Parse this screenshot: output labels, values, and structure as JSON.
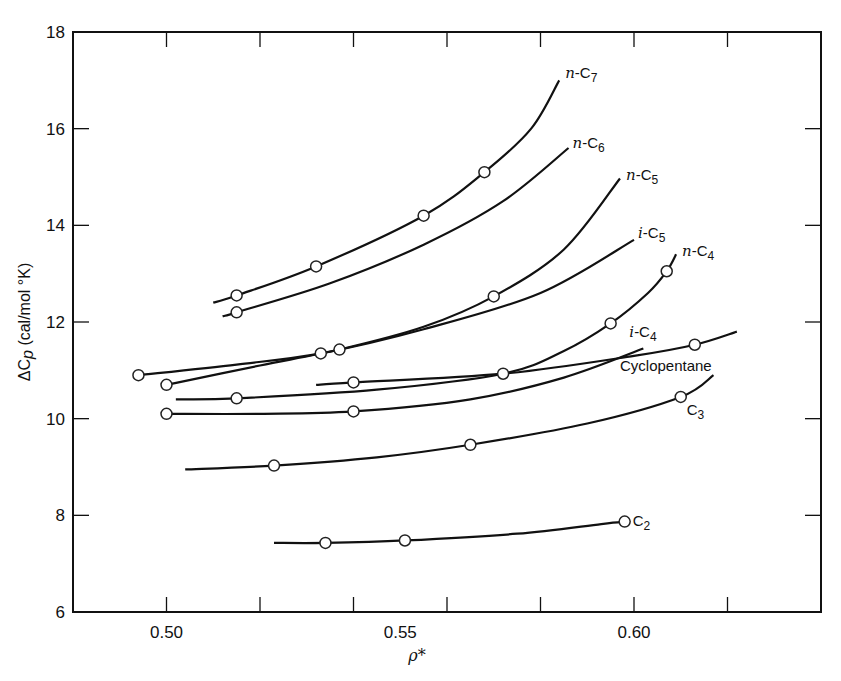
{
  "chart_data": {
    "type": "line",
    "title": "",
    "xlabel": "ρ*",
    "ylabel": "ΔCp (cal/mol °K)",
    "xlim": [
      0.48,
      0.64
    ],
    "ylim": [
      6,
      18
    ],
    "x_ticks": [
      0.49,
      0.5,
      0.51,
      0.52,
      0.53,
      0.54,
      0.55,
      0.56,
      0.57,
      0.58,
      0.59,
      0.6,
      0.61,
      0.62,
      0.63
    ],
    "x_major_ticks": [
      0.5,
      0.52,
      0.54,
      0.56,
      0.58,
      0.6,
      0.62
    ],
    "x_tick_labels": [
      {
        "value": 0.5,
        "label": "0.50"
      },
      {
        "value": 0.55,
        "label": "0.55"
      },
      {
        "value": 0.6,
        "label": "0.60"
      }
    ],
    "y_ticks": [
      6,
      8,
      10,
      12,
      14,
      16,
      18
    ],
    "y_tick_labels": [
      "6",
      "8",
      "10",
      "12",
      "14",
      "16",
      "18"
    ],
    "grid": false,
    "legend": "inline labels at curve ends",
    "series": [
      {
        "name": "n-C7",
        "label_main": "n",
        "label_rest": "-C",
        "label_sub": "7",
        "curve": [
          [
            0.51,
            12.4
          ],
          [
            0.515,
            12.55
          ],
          [
            0.532,
            13.15
          ],
          [
            0.555,
            14.2
          ],
          [
            0.568,
            15.1
          ],
          [
            0.578,
            16.0
          ],
          [
            0.584,
            17.0
          ]
        ],
        "points": [
          [
            0.515,
            12.55
          ],
          [
            0.532,
            13.15
          ],
          [
            0.555,
            14.2
          ],
          [
            0.568,
            15.1
          ]
        ]
      },
      {
        "name": "n-C6",
        "label_main": "n",
        "label_rest": "-C",
        "label_sub": "6",
        "curve": [
          [
            0.512,
            12.12
          ],
          [
            0.515,
            12.2
          ],
          [
            0.535,
            12.8
          ],
          [
            0.555,
            13.6
          ],
          [
            0.572,
            14.5
          ],
          [
            0.586,
            15.6
          ]
        ],
        "points": [
          [
            0.515,
            12.2
          ]
        ]
      },
      {
        "name": "n-C5",
        "label_main": "n",
        "label_rest": "-C",
        "label_sub": "5",
        "curve": [
          [
            0.5,
            10.7
          ],
          [
            0.52,
            11.1
          ],
          [
            0.537,
            11.43
          ],
          [
            0.555,
            11.9
          ],
          [
            0.57,
            12.53
          ],
          [
            0.585,
            13.5
          ],
          [
            0.597,
            14.97
          ]
        ],
        "points": [
          [
            0.5,
            10.7
          ],
          [
            0.537,
            11.43
          ],
          [
            0.57,
            12.53
          ]
        ]
      },
      {
        "name": "i-C5",
        "label_main": "i",
        "label_rest": "-C",
        "label_sub": "5",
        "curve": [
          [
            0.494,
            10.9
          ],
          [
            0.515,
            11.12
          ],
          [
            0.533,
            11.35
          ],
          [
            0.555,
            11.85
          ],
          [
            0.58,
            12.6
          ],
          [
            0.6,
            13.7
          ]
        ],
        "points": [
          [
            0.494,
            10.9
          ],
          [
            0.533,
            11.35
          ]
        ]
      },
      {
        "name": "n-C4",
        "label_main": "n",
        "label_rest": "-C",
        "label_sub": "4",
        "curve": [
          [
            0.502,
            10.4
          ],
          [
            0.515,
            10.42
          ],
          [
            0.545,
            10.6
          ],
          [
            0.572,
            10.93
          ],
          [
            0.585,
            11.4
          ],
          [
            0.595,
            11.97
          ],
          [
            0.603,
            12.6
          ],
          [
            0.607,
            13.05
          ],
          [
            0.609,
            13.4
          ]
        ],
        "points": [
          [
            0.515,
            10.42
          ],
          [
            0.572,
            10.93
          ],
          [
            0.595,
            11.97
          ],
          [
            0.607,
            13.05
          ]
        ]
      },
      {
        "name": "i-C4",
        "label_main": "i",
        "label_rest": "-C",
        "label_sub": "4",
        "curve": [
          [
            0.5,
            10.1
          ],
          [
            0.52,
            10.1
          ],
          [
            0.54,
            10.15
          ],
          [
            0.565,
            10.4
          ],
          [
            0.585,
            10.85
          ],
          [
            0.602,
            11.45
          ]
        ],
        "points": [
          [
            0.5,
            10.1
          ],
          [
            0.54,
            10.15
          ]
        ]
      },
      {
        "name": "Cyclopentane",
        "label_main": "",
        "label_rest": "Cyclopentane",
        "label_sub": "",
        "curve": [
          [
            0.532,
            10.7
          ],
          [
            0.54,
            10.75
          ],
          [
            0.572,
            10.93
          ],
          [
            0.6,
            11.3
          ],
          [
            0.613,
            11.53
          ],
          [
            0.622,
            11.8
          ]
        ],
        "points": [
          [
            0.54,
            10.75
          ],
          [
            0.613,
            11.53
          ]
        ]
      },
      {
        "name": "C3",
        "label_main": "",
        "label_rest": "C",
        "label_sub": "3",
        "curve": [
          [
            0.504,
            8.95
          ],
          [
            0.523,
            9.03
          ],
          [
            0.545,
            9.2
          ],
          [
            0.565,
            9.46
          ],
          [
            0.59,
            9.9
          ],
          [
            0.61,
            10.45
          ],
          [
            0.617,
            10.9
          ]
        ],
        "points": [
          [
            0.523,
            9.03
          ],
          [
            0.565,
            9.46
          ],
          [
            0.61,
            10.45
          ]
        ]
      },
      {
        "name": "C2",
        "label_main": "",
        "label_rest": "C",
        "label_sub": "2",
        "curve": [
          [
            0.523,
            7.43
          ],
          [
            0.534,
            7.43
          ],
          [
            0.551,
            7.48
          ],
          [
            0.575,
            7.62
          ],
          [
            0.593,
            7.82
          ],
          [
            0.598,
            7.87
          ]
        ],
        "points": [
          [
            0.534,
            7.43
          ],
          [
            0.551,
            7.48
          ],
          [
            0.598,
            7.87
          ]
        ]
      }
    ]
  },
  "labels": {
    "xlabel": "ρ*",
    "ylabel_delta": "ΔC",
    "ylabel_p": "p",
    "ylabel_units": " (cal/mol °K)"
  }
}
